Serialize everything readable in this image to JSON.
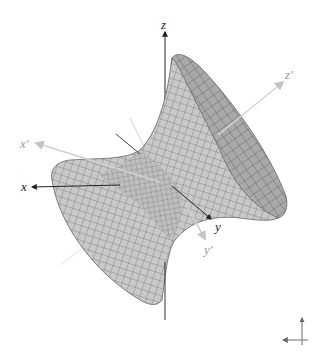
{
  "figure": {
    "surface": {
      "fill_light": "#c8c8c8",
      "fill_dark": "#a8a8a8",
      "mesh_color": "#555555"
    },
    "axes": {
      "x": {
        "label": "x",
        "color": "#222222"
      },
      "y": {
        "label": "y",
        "color": "#222222"
      },
      "z": {
        "label": "z",
        "color": "#222222"
      },
      "x_prime": {
        "label": "x′",
        "color": "#b8b8b8"
      },
      "y_prime": {
        "label": "y′",
        "color": "#b8b8b8"
      },
      "z_prime": {
        "label": "z′",
        "color": "#b8b8b8"
      }
    },
    "orientation_gizmo": {
      "name": "view-orientation-indicator"
    }
  }
}
